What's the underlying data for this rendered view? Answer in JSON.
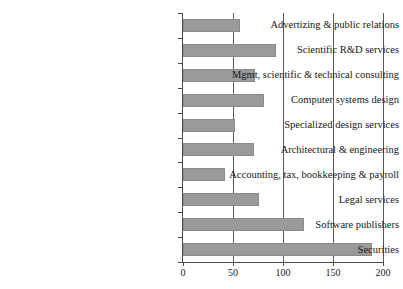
{
  "chart_data": {
    "type": "bar",
    "orientation": "horizontal",
    "title": "",
    "subtitle": "",
    "xlabel": "",
    "ylabel": "",
    "xlim": [
      0,
      200
    ],
    "xticks": [
      0,
      50,
      100,
      150,
      200
    ],
    "xtick_labels": [
      "0",
      "50",
      "100",
      "150",
      "200"
    ],
    "grid": "vertical",
    "legend": "none",
    "bar_color": "#9a9a9a",
    "bar_edge_color": "#8a8a8a",
    "axis_color": "#4a4a4a",
    "categories": [
      "Advertizing & public relations",
      "Scientific R&D services",
      "Mgmt, scientific & technical consulting",
      "Computer systems design",
      "Specialized design services",
      "Architectural & engineering",
      "Accounting, tax, bookkeeping & payroll",
      "Legal services",
      "Software publishers",
      "Securities"
    ],
    "values": [
      57,
      93,
      72,
      81,
      52,
      71,
      42,
      76,
      121,
      189
    ]
  }
}
